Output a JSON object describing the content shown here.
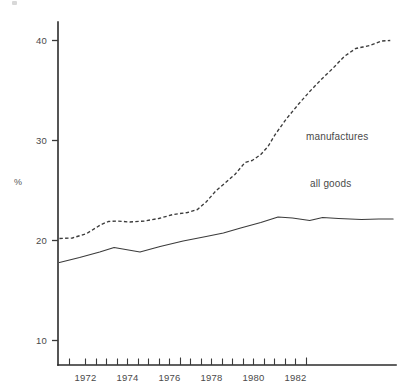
{
  "page": {
    "background_color": "#ffffff",
    "ink_color": "#3b3b3b"
  },
  "chart_data": {
    "type": "line",
    "title": "",
    "subtitle": "",
    "xlabel": "",
    "ylabel": "%",
    "xlim": [
      1971.25,
      1983.0
    ],
    "ylim": [
      7.6,
      40.9
    ],
    "grid": false,
    "legend_position": "inline-right",
    "y_ticks": [
      10,
      20,
      30,
      40
    ],
    "y_tick_labels": [
      "10",
      "20",
      "30",
      "40"
    ],
    "x_ticks": [
      1971.5,
      1972,
      1972.5,
      1973,
      1973.5,
      1974,
      1974.5,
      1975,
      1975.5,
      1976,
      1976.5,
      1977,
      1977.5,
      1978,
      1978.5,
      1979,
      1979.5,
      1980,
      1980.5,
      1981,
      1981.5,
      1982,
      1982.5
    ],
    "x_tick_labels": [
      "1972",
      "1974",
      "1976",
      "1978",
      "1980",
      "1982"
    ],
    "x_labelled_ticks": [
      1972,
      1974,
      1976,
      1978,
      1980,
      1982
    ],
    "series": [
      {
        "name": "manufactures",
        "style": "dashed",
        "label_x": 1982.1,
        "label_y": 29.2,
        "x": [
          1971.3,
          1971.75,
          1972.25,
          1972.75,
          1973.0,
          1973.3,
          1973.75,
          1974.25,
          1974.75,
          1975.25,
          1975.75,
          1976.1,
          1976.4,
          1976.75,
          1977.0,
          1977.4,
          1977.75,
          1978.0,
          1978.3,
          1978.55,
          1978.8,
          1979.2,
          1979.6,
          1980.0,
          1980.4,
          1980.8,
          1981.2,
          1981.6,
          1981.85,
          1982.1,
          1982.5,
          1982.8
        ],
        "y": [
          20.2,
          20.25,
          20.7,
          21.6,
          21.9,
          21.95,
          21.85,
          21.95,
          22.2,
          22.6,
          22.8,
          23.1,
          23.85,
          25.0,
          25.6,
          26.6,
          27.8,
          28.0,
          28.6,
          29.4,
          30.6,
          32.2,
          33.6,
          34.9,
          36.1,
          37.2,
          38.4,
          39.2,
          39.35,
          39.5,
          39.95,
          40.0
        ]
      },
      {
        "name": "all goods",
        "style": "solid",
        "label_x": 1982.1,
        "label_y": 24.6,
        "x": [
          1971.3,
          1972.0,
          1972.7,
          1973.2,
          1974.1,
          1974.8,
          1975.6,
          1976.4,
          1977.0,
          1977.6,
          1978.3,
          1978.9,
          1979.4,
          1980.0,
          1980.45,
          1981.0,
          1981.8,
          1982.4,
          1982.9
        ],
        "y": [
          17.8,
          18.3,
          18.85,
          19.3,
          18.85,
          19.4,
          19.95,
          20.4,
          20.75,
          21.25,
          21.8,
          22.35,
          22.25,
          22.0,
          22.3,
          22.2,
          22.1,
          22.15,
          22.15
        ]
      }
    ],
    "series_labels": [
      {
        "text": "manufactures",
        "x": 306,
        "y": 140
      },
      {
        "text": "all goods",
        "x": 310,
        "y": 187
      }
    ]
  },
  "geometry": {
    "plot_left": 58,
    "plot_right": 396,
    "plot_top": 22,
    "plot_bottom": 365,
    "y_axis_top": 22,
    "y_axis_bottom": 365,
    "px_per_year": 21.0,
    "px_per_percent": 10.0
  },
  "labels": {
    "y_axis_caption": "%",
    "y_axis_caption_x": 18,
    "y_axis_caption_y": 181
  }
}
